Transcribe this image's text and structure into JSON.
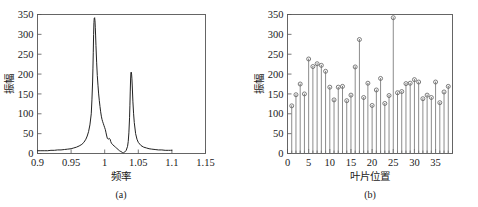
{
  "figure": {
    "panel_a_caption": "(a)",
    "panel_b_caption": "(b)"
  },
  "chart_data": [
    {
      "id": "panel-a",
      "type": "line",
      "title": "",
      "caption": "(a)",
      "xlabel": "频率",
      "ylabel": "振幅",
      "xlim": [
        0.9,
        1.15
      ],
      "ylim": [
        0,
        350
      ],
      "grid": false,
      "legend": null,
      "xticks": [
        0.9,
        0.95,
        1,
        1.05,
        1.1,
        1.15
      ],
      "xticklabels": [
        "0.9",
        "0.95",
        "1",
        "1.05",
        "1.1",
        "1.15"
      ],
      "yticks": [
        0,
        50,
        100,
        150,
        200,
        250,
        300,
        350
      ],
      "yticklabels": [
        "0",
        "50",
        "100",
        "150",
        "200",
        "250",
        "300",
        "350"
      ],
      "series": [
        {
          "name": "frequency-response",
          "x": [
            0.9,
            0.905,
            0.91,
            0.915,
            0.92,
            0.925,
            0.93,
            0.935,
            0.94,
            0.945,
            0.95,
            0.954,
            0.958,
            0.962,
            0.966,
            0.969,
            0.972,
            0.974,
            0.976,
            0.978,
            0.98,
            0.981,
            0.982,
            0.9825,
            0.983,
            0.9835,
            0.984,
            0.9845,
            0.985,
            0.9855,
            0.986,
            0.9865,
            0.987,
            0.988,
            0.989,
            0.99,
            0.991,
            0.992,
            0.993,
            0.994,
            0.995,
            0.996,
            0.997,
            0.998,
            0.999,
            1.0,
            1.001,
            1.002,
            1.003,
            1.004,
            1.005,
            1.006,
            1.007,
            1.008,
            1.009,
            1.01,
            1.012,
            1.014,
            1.016,
            1.018,
            1.02,
            1.022,
            1.024,
            1.026,
            1.027,
            1.028,
            1.029,
            1.03,
            1.032,
            1.034,
            1.035,
            1.036,
            1.037,
            1.0375,
            1.038,
            1.0385,
            1.039,
            1.0395,
            1.04,
            1.0405,
            1.041,
            1.042,
            1.043,
            1.044,
            1.046,
            1.048,
            1.05,
            1.054,
            1.058,
            1.062,
            1.066,
            1.07,
            1.075,
            1.08,
            1.085,
            1.09,
            1.095,
            1.098,
            1.1
          ],
          "y": [
            7,
            7,
            7,
            7,
            8,
            8,
            9,
            9,
            10,
            11,
            12,
            14,
            16,
            19,
            23,
            28,
            36,
            44,
            55,
            72,
            100,
            135,
            180,
            215,
            255,
            300,
            330,
            341,
            342,
            335,
            318,
            296,
            272,
            230,
            196,
            172,
            150,
            133,
            118,
            105,
            94,
            86,
            80,
            75,
            70,
            65,
            60,
            52,
            44,
            38,
            36,
            37,
            38,
            36,
            30,
            26,
            22,
            19,
            16,
            13,
            10,
            7,
            5,
            3,
            2,
            2,
            3,
            4,
            8,
            18,
            30,
            52,
            90,
            120,
            155,
            185,
            203,
            205,
            200,
            188,
            170,
            130,
            100,
            78,
            50,
            36,
            28,
            20,
            16,
            14,
            12,
            11,
            10,
            9,
            9,
            8,
            8,
            8,
            8
          ]
        }
      ],
      "annotations": [
        {
          "text": "peak-1",
          "x": 0.985,
          "y": 342
        },
        {
          "text": "peak-2",
          "x": 1.0395,
          "y": 205
        },
        {
          "text": "minimum",
          "x": 1.027,
          "y": 2
        }
      ]
    },
    {
      "id": "panel-b",
      "type": "scatter",
      "subtype": "stem",
      "title": "",
      "caption": "(b)",
      "xlabel": "叶片位置",
      "ylabel": "振幅",
      "xlim": [
        0,
        39
      ],
      "ylim": [
        0,
        350
      ],
      "grid": false,
      "legend": null,
      "xticks": [
        0,
        5,
        10,
        15,
        20,
        25,
        30,
        35
      ],
      "xticklabels": [
        "0",
        "5",
        "10",
        "15",
        "20",
        "25",
        "30",
        "35"
      ],
      "yticks": [
        0,
        50,
        100,
        150,
        200,
        250,
        300,
        350
      ],
      "yticklabels": [
        "0",
        "50",
        "100",
        "150",
        "200",
        "250",
        "300",
        "350"
      ],
      "x": [
        1,
        2,
        3,
        4,
        5,
        6,
        7,
        8,
        9,
        10,
        11,
        12,
        13,
        14,
        15,
        16,
        17,
        18,
        19,
        20,
        21,
        22,
        23,
        24,
        25,
        26,
        27,
        28,
        29,
        30,
        31,
        32,
        33,
        34,
        35,
        36,
        37,
        38
      ],
      "values": [
        120,
        148,
        175,
        150,
        238,
        219,
        226,
        222,
        207,
        167,
        135,
        167,
        169,
        133,
        147,
        218,
        287,
        141,
        177,
        121,
        160,
        189,
        126,
        146,
        342,
        153,
        156,
        176,
        177,
        186,
        180,
        138,
        147,
        141,
        180,
        128,
        155,
        169
      ],
      "series": [
        {
          "name": "blade-amplitude",
          "values": [
            120,
            148,
            175,
            150,
            238,
            219,
            226,
            222,
            207,
            167,
            135,
            167,
            169,
            133,
            147,
            218,
            287,
            141,
            177,
            121,
            160,
            189,
            126,
            146,
            342,
            153,
            156,
            176,
            177,
            186,
            180,
            138,
            147,
            141,
            180,
            128,
            155,
            169
          ]
        }
      ]
    }
  ]
}
